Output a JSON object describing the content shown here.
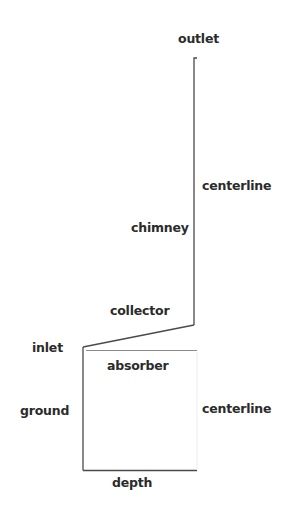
{
  "diagram": {
    "type": "solar-chimney-domain-schematic",
    "labels": {
      "outlet": "outlet",
      "centerline_upper": "centerline",
      "chimney": "chimney",
      "collector": "collector",
      "inlet": "inlet",
      "absorber": "absorber",
      "ground": "ground",
      "centerline_lower": "centerline",
      "depth": "depth"
    },
    "colors": {
      "line": "#4a4a4a",
      "faint_line": "#c8c8c8",
      "absorber_line": "#8a8a8a",
      "text": "#2b2b2b",
      "background": "#ffffff"
    }
  }
}
